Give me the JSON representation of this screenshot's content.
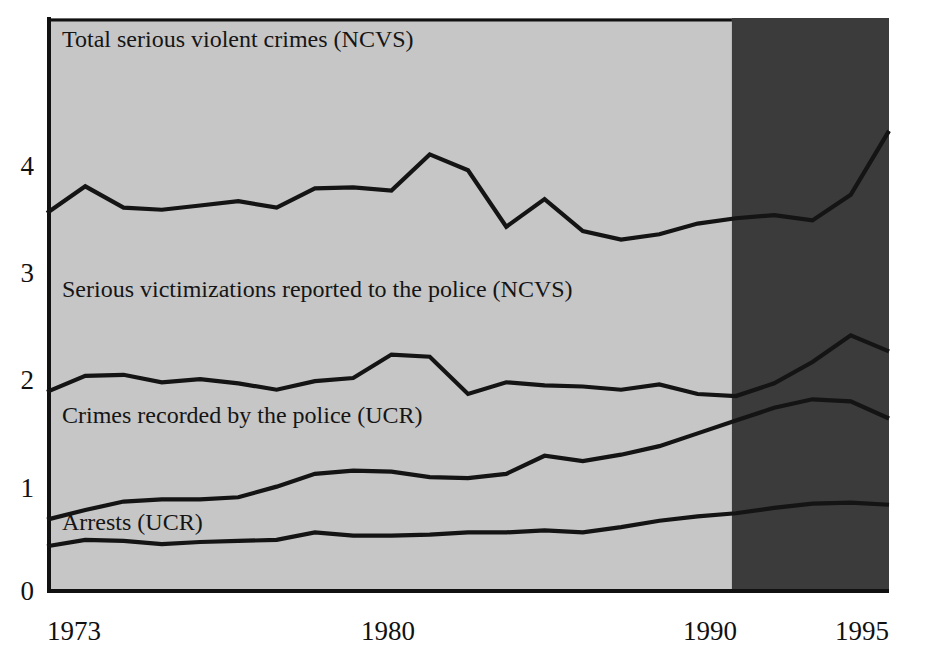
{
  "chart_data": {
    "type": "line",
    "title": "",
    "subtitle": "",
    "xlabel": "",
    "ylabel": "",
    "xlim": [
      1973,
      1995
    ],
    "ylim": [
      0,
      4.6
    ],
    "grid": false,
    "legend_position": "inline-labels",
    "x_tick_labels": [
      "1973",
      "1980",
      "1990",
      "1995"
    ],
    "x_tick_values": [
      1973,
      1980,
      1990,
      1995
    ],
    "y_tick_labels": [
      "0",
      "1",
      "2",
      "3",
      "4"
    ],
    "y_tick_values": [
      0,
      1,
      2,
      3,
      4
    ],
    "x": [
      1973,
      1974,
      1975,
      1976,
      1977,
      1978,
      1979,
      1980,
      1981,
      1982,
      1983,
      1984,
      1985,
      1986,
      1987,
      1988,
      1989,
      1990,
      1991,
      1992,
      1993,
      1994,
      1995
    ],
    "series": [
      {
        "name": "Total serious violent crimes (NCVS)",
        "label": "Total serious violent crimes (NCVS)",
        "values": [
          3.55,
          3.8,
          3.6,
          3.58,
          3.62,
          3.66,
          3.6,
          3.78,
          3.79,
          3.76,
          4.1,
          3.95,
          3.42,
          3.68,
          3.38,
          3.3,
          3.35,
          3.45,
          3.5,
          3.53,
          3.48,
          3.72,
          4.32
        ]
      },
      {
        "name": "Serious victimizations reported to the police (NCVS)",
        "label": "Serious victimizations reported to the police (NCVS)",
        "values": [
          1.87,
          2.02,
          2.03,
          1.96,
          1.99,
          1.95,
          1.89,
          1.97,
          2.0,
          2.22,
          2.2,
          1.85,
          1.96,
          1.93,
          1.92,
          1.89,
          1.94,
          1.85,
          1.83,
          1.95,
          2.15,
          2.4,
          2.25
        ]
      },
      {
        "name": "Crimes recorded by the police (UCR)",
        "label": "Crimes recorded by the police (UCR)",
        "values": [
          0.67,
          0.76,
          0.84,
          0.86,
          0.86,
          0.88,
          0.98,
          1.1,
          1.13,
          1.12,
          1.07,
          1.06,
          1.1,
          1.27,
          1.22,
          1.28,
          1.36,
          1.48,
          1.6,
          1.72,
          1.8,
          1.78,
          1.62
        ]
      },
      {
        "name": "Arrests (UCR)",
        "label": "Arrests (UCR)",
        "values": [
          0.42,
          0.48,
          0.47,
          0.44,
          0.46,
          0.47,
          0.48,
          0.55,
          0.52,
          0.52,
          0.53,
          0.55,
          0.55,
          0.57,
          0.55,
          0.6,
          0.66,
          0.7,
          0.73,
          0.78,
          0.82,
          0.83,
          0.81
        ]
      }
    ],
    "annotations": [
      {
        "name": "shaded-recent-period",
        "type": "band",
        "x_start": 1991,
        "x_end": 1995,
        "color": "#3b3b3b",
        "description": "Darker shaded band covering 1991-1995"
      }
    ]
  },
  "colors": {
    "plot_background": "#c6c6c6",
    "highlight_background": "#3b3b3b",
    "line": "#141414",
    "axis": "#111111",
    "page_background": "#ffffff",
    "tick_text": "#111111"
  },
  "axis": {
    "y_ticks": [
      {
        "label": "4",
        "value": 4
      },
      {
        "label": "3",
        "value": 3
      },
      {
        "label": "2",
        "value": 2
      },
      {
        "label": "1",
        "value": 1
      },
      {
        "label": "0",
        "value": 0
      }
    ],
    "x_ticks": [
      {
        "label": "1973",
        "value": 1973
      },
      {
        "label": "1980",
        "value": 1980
      },
      {
        "label": "1990",
        "value": 1990
      },
      {
        "label": "1995",
        "value": 1995
      }
    ]
  },
  "series_labels": [
    {
      "text": "Total serious violent crimes (NCVS)"
    },
    {
      "text": "Serious victimizations reported to the police (NCVS)"
    },
    {
      "text": "Crimes recorded by the police (UCR)"
    },
    {
      "text": "Arrests (UCR)"
    }
  ]
}
